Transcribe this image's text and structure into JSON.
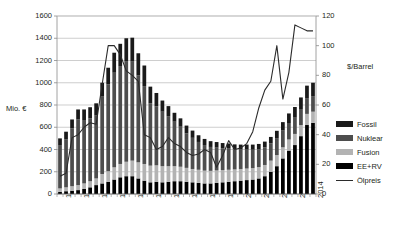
{
  "chart_data": {
    "type": "bar",
    "title": "",
    "subtitle": "",
    "xlabel": "",
    "ylabel": "Mio. €",
    "y2label": "$/Barrel",
    "ylim": [
      0,
      1600
    ],
    "y2lim": [
      0,
      120
    ],
    "yticks": [
      0,
      200,
      400,
      600,
      800,
      1000,
      1200,
      1400,
      1600
    ],
    "y2ticks": [
      0,
      20,
      40,
      60,
      80,
      100,
      120
    ],
    "grid": true,
    "legend_position": "right",
    "stacked": true,
    "x": [
      1972,
      1973,
      1974,
      1975,
      1976,
      1977,
      1978,
      1979,
      1980,
      1981,
      1982,
      1983,
      1984,
      1985,
      1986,
      1987,
      1988,
      1989,
      1990,
      1991,
      1992,
      1993,
      1994,
      1995,
      1996,
      1997,
      1998,
      1999,
      2000,
      2001,
      2002,
      2003,
      2004,
      2005,
      2006,
      2007,
      2008,
      2009,
      2010,
      2011,
      2012,
      2013,
      2014
    ],
    "xtick_labels": [
      "1972",
      "1975",
      "1978",
      "1981",
      "1984",
      "1987",
      "1990",
      "1993",
      "1996",
      "1999",
      "2002",
      "2005",
      "2008",
      "2011",
      "2014"
    ],
    "series": [
      {
        "name": "Fossil",
        "color": "#1a1a1a",
        "values": [
          60,
          70,
          80,
          90,
          95,
          100,
          110,
          120,
          150,
          180,
          200,
          210,
          215,
          200,
          185,
          150,
          120,
          100,
          90,
          80,
          75,
          70,
          65,
          60,
          55,
          52,
          50,
          48,
          46,
          45,
          44,
          45,
          46,
          48,
          52,
          58,
          66,
          76,
          86,
          96,
          104,
          112,
          120
        ]
      },
      {
        "name": "Nuklear",
        "color": "#4d4d4d",
        "values": [
          390,
          430,
          520,
          590,
          570,
          565,
          565,
          700,
          780,
          850,
          880,
          900,
          890,
          780,
          700,
          560,
          530,
          490,
          450,
          400,
          360,
          310,
          280,
          250,
          230,
          215,
          205,
          195,
          190,
          180,
          175,
          170,
          165,
          160,
          158,
          155,
          152,
          150,
          148,
          146,
          144,
          142,
          140
        ]
      },
      {
        "name": "Fusion",
        "color": "#b3b3b3",
        "values": [
          30,
          35,
          40,
          45,
          50,
          55,
          60,
          85,
          95,
          110,
          120,
          130,
          140,
          145,
          150,
          150,
          148,
          145,
          140,
          135,
          130,
          125,
          120,
          118,
          115,
          113,
          112,
          110,
          108,
          106,
          105,
          104,
          103,
          102,
          101,
          100,
          100,
          100,
          100,
          100,
          100,
          100,
          100
        ]
      },
      {
        "name": "EE+RV",
        "color": "#000000",
        "values": [
          20,
          25,
          30,
          35,
          45,
          60,
          80,
          95,
          110,
          130,
          150,
          160,
          160,
          140,
          120,
          105,
          110,
          105,
          110,
          115,
          115,
          110,
          105,
          100,
          95,
          95,
          100,
          105,
          110,
          115,
          120,
          125,
          130,
          140,
          160,
          200,
          250,
          320,
          390,
          440,
          520,
          620,
          640
        ]
      }
    ],
    "line_series": {
      "name": "Ölpreis",
      "color": "#2b2b2b",
      "axis": "y2",
      "values": [
        12,
        14,
        38,
        40,
        45,
        48,
        47,
        74,
        100,
        100,
        94,
        83,
        80,
        76,
        40,
        38,
        30,
        32,
        38,
        34,
        32,
        28,
        26,
        27,
        30,
        28,
        18,
        26,
        36,
        30,
        31,
        34,
        42,
        58,
        70,
        76,
        100,
        64,
        82,
        114,
        112,
        110,
        110
      ]
    }
  },
  "legend": {
    "items": [
      {
        "label": "Fossil",
        "type": "swatch",
        "color": "#1a1a1a"
      },
      {
        "label": "Nuklear",
        "type": "swatch",
        "color": "#4d4d4d"
      },
      {
        "label": "Fusion",
        "type": "swatch",
        "color": "#b3b3b3"
      },
      {
        "label": "EE+RV",
        "type": "swatch",
        "color": "#000000"
      },
      {
        "label": "Ölpreis",
        "type": "line",
        "color": "#2b2b2b"
      }
    ]
  },
  "axes": {
    "left_unit": "Mio. €",
    "right_unit": "$/Barrel"
  }
}
